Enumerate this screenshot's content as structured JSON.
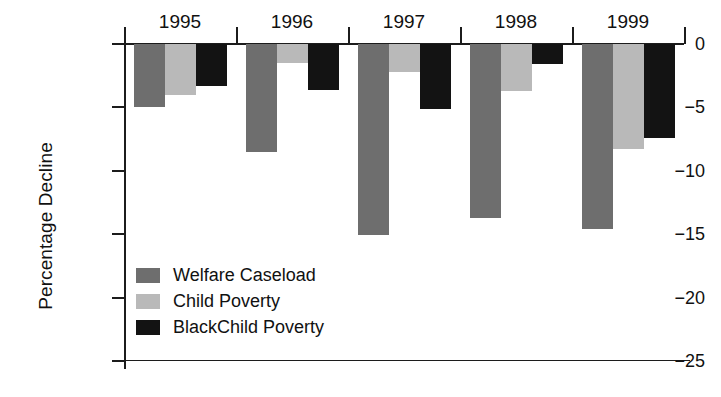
{
  "chart_data": {
    "type": "bar",
    "title": "",
    "xlabel": "",
    "ylabel": "Percentage Decline",
    "ylim": [
      -25,
      0
    ],
    "yticks": [
      0,
      -5,
      -10,
      -15,
      -20,
      -25
    ],
    "ytick_labels": [
      "0",
      "−5",
      "−10",
      "−15",
      "−20",
      "−25"
    ],
    "grid": false,
    "legend_position": "inside-lower-left",
    "categories": [
      "1995",
      "1996",
      "1997",
      "1998",
      "1999"
    ],
    "series": [
      {
        "name": "Welfare Caseload",
        "color": "#6e6e6e",
        "values": [
          -5.0,
          -8.5,
          -15.1,
          -13.7,
          -14.6
        ]
      },
      {
        "name": "Child Poverty",
        "color": "#b9b9b9",
        "values": [
          -4.0,
          -1.5,
          -2.2,
          -3.7,
          -8.3
        ]
      },
      {
        "name": "BlackChild Poverty",
        "color": "#131313",
        "values": [
          -3.3,
          -3.6,
          -5.1,
          -1.6,
          -7.4
        ]
      }
    ]
  }
}
